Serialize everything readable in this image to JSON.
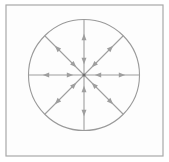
{
  "figure": {
    "title": "Radial vector field inside a circle",
    "caption": "",
    "width": 169,
    "height": 162,
    "background_color": "#ffffff"
  },
  "frame": {
    "name": "outer-square-frame",
    "stroke_color": "#a8a8a8",
    "inner_fill": "#fdfdfd",
    "stroke_width": 1.2,
    "x": 6,
    "y": 5,
    "width": 157,
    "height": 151
  },
  "circle": {
    "name": "boundary-circle",
    "center_x": 84,
    "center_y": 75,
    "radius": 55.5,
    "stroke_color": "#9a9a9a",
    "stroke_width": 1.1,
    "fill": "none"
  },
  "center_point": {
    "name": "origin-dot",
    "x": 84,
    "y": 75,
    "radius": 1.6,
    "color": "#6d6d6d"
  },
  "vectors": {
    "stroke_color": "#9e9e9e",
    "arrowhead_color": "#9e9e9e",
    "stroke_width": 1.1,
    "count": 8,
    "inner_head_radius": 14,
    "outer_head_radius": 38,
    "ray_length": 55.5,
    "rays": [
      {
        "label": "east",
        "angle_deg": 0,
        "direction": "right"
      },
      {
        "label": "northeast",
        "angle_deg": 45,
        "direction": "up-right"
      },
      {
        "label": "north",
        "angle_deg": 90,
        "direction": "up"
      },
      {
        "label": "northwest",
        "angle_deg": 135,
        "direction": "up-left"
      },
      {
        "label": "west",
        "angle_deg": 180,
        "direction": "left"
      },
      {
        "label": "southwest",
        "angle_deg": 225,
        "direction": "down-left"
      },
      {
        "label": "south",
        "angle_deg": 270,
        "direction": "down"
      },
      {
        "label": "southeast",
        "angle_deg": 315,
        "direction": "down-right"
      }
    ]
  },
  "chart_data": {
    "type": "scatter",
    "title": "Radial vector field inside a circle",
    "xlabel": "",
    "ylabel": "",
    "xlim": [
      -1,
      1
    ],
    "ylim": [
      -1,
      1
    ],
    "grid": false,
    "legend": null,
    "series": [
      {
        "name": "outward-arrowheads",
        "values": [
          {
            "angle_deg": 0,
            "r": 0.68,
            "u": 1.0,
            "v": 0.0
          },
          {
            "angle_deg": 45,
            "r": 0.68,
            "u": 0.707,
            "v": 0.707
          },
          {
            "angle_deg": 90,
            "r": 0.68,
            "u": 0.0,
            "v": 1.0
          },
          {
            "angle_deg": 135,
            "r": 0.68,
            "u": -0.707,
            "v": 0.707
          },
          {
            "angle_deg": 180,
            "r": 0.68,
            "u": -1.0,
            "v": 0.0
          },
          {
            "angle_deg": 225,
            "r": 0.68,
            "u": -0.707,
            "v": -0.707
          },
          {
            "angle_deg": 270,
            "r": 0.68,
            "u": 0.0,
            "v": -1.0
          },
          {
            "angle_deg": 315,
            "r": 0.68,
            "u": 0.707,
            "v": -0.707
          }
        ]
      },
      {
        "name": "inward-arrowheads",
        "values": [
          {
            "angle_deg": 0,
            "r": 0.25,
            "u": -1.0,
            "v": 0.0
          },
          {
            "angle_deg": 45,
            "r": 0.25,
            "u": -0.707,
            "v": -0.707
          },
          {
            "angle_deg": 90,
            "r": 0.25,
            "u": 0.0,
            "v": -1.0
          },
          {
            "angle_deg": 135,
            "r": 0.25,
            "u": 0.707,
            "v": -0.707
          },
          {
            "angle_deg": 180,
            "r": 0.25,
            "u": 1.0,
            "v": 0.0
          },
          {
            "angle_deg": 225,
            "r": 0.25,
            "u": 0.707,
            "v": 0.707
          },
          {
            "angle_deg": 270,
            "r": 0.25,
            "u": 0.0,
            "v": 1.0
          },
          {
            "angle_deg": 315,
            "r": 0.25,
            "u": -0.707,
            "v": 0.707
          }
        ]
      }
    ]
  }
}
